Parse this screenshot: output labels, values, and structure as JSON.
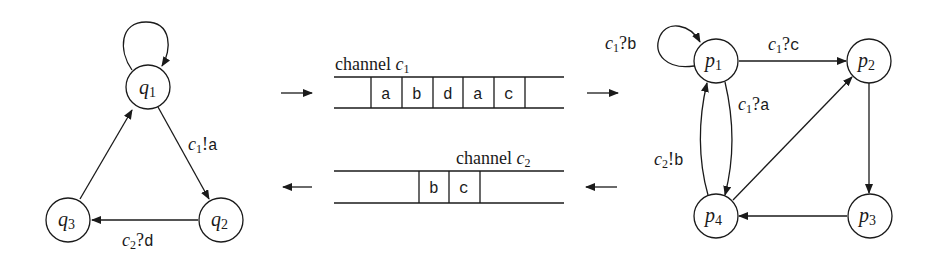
{
  "diagram": {
    "left_automaton": {
      "states": [
        {
          "id": "q1",
          "name": "q",
          "sub": "1"
        },
        {
          "id": "q2",
          "name": "q",
          "sub": "2"
        },
        {
          "id": "q3",
          "name": "q",
          "sub": "3"
        }
      ],
      "transitions": [
        {
          "from": "q1",
          "to": "q1",
          "label": ""
        },
        {
          "from": "q1",
          "to": "q2",
          "label_ch": "c",
          "label_sub": "1",
          "label_op": "!",
          "label_msg": "a"
        },
        {
          "from": "q2",
          "to": "q3",
          "label_ch": "c",
          "label_sub": "2",
          "label_op": "?",
          "label_msg": "d"
        },
        {
          "from": "q3",
          "to": "q1",
          "label": ""
        }
      ]
    },
    "channels": [
      {
        "label": "channel",
        "var": "c",
        "sub": "1",
        "contents": [
          "a",
          "b",
          "d",
          "a",
          "c"
        ],
        "direction": "right"
      },
      {
        "label": "channel",
        "var": "c",
        "sub": "2",
        "contents": [
          "b",
          "c"
        ],
        "direction": "left"
      }
    ],
    "right_automaton": {
      "states": [
        {
          "id": "p1",
          "name": "p",
          "sub": "1"
        },
        {
          "id": "p2",
          "name": "p",
          "sub": "2"
        },
        {
          "id": "p3",
          "name": "p",
          "sub": "3"
        },
        {
          "id": "p4",
          "name": "p",
          "sub": "4"
        }
      ],
      "transitions": [
        {
          "from": "p1",
          "to": "p1",
          "label_ch": "c",
          "label_sub": "1",
          "label_op": "?",
          "label_msg": "b"
        },
        {
          "from": "p1",
          "to": "p2",
          "label_ch": "c",
          "label_sub": "1",
          "label_op": "?",
          "label_msg": "c"
        },
        {
          "from": "p1",
          "to": "p4",
          "label_ch": "c",
          "label_sub": "1",
          "label_op": "?",
          "label_msg": "a"
        },
        {
          "from": "p4",
          "to": "p1",
          "label_ch": "c",
          "label_sub": "2",
          "label_op": "!",
          "label_msg": "b"
        },
        {
          "from": "p4",
          "to": "p2",
          "label": ""
        },
        {
          "from": "p2",
          "to": "p3",
          "label": ""
        },
        {
          "from": "p3",
          "to": "p4",
          "label": ""
        }
      ]
    }
  }
}
